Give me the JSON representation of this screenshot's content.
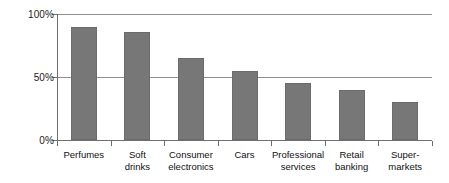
{
  "chart_data": {
    "type": "bar",
    "title": "",
    "subtitle": "",
    "xlabel": "",
    "ylabel": "",
    "categories": [
      "Perfumes",
      "Soft\ndrinks",
      "Consumer\nelectronics",
      "Cars",
      "Professional\nservices",
      "Retail\nbanking",
      "Super-\nmarkets"
    ],
    "values": [
      90,
      86,
      65,
      55,
      45,
      40,
      30
    ],
    "value_unit": "%",
    "ylim": [
      0,
      100
    ],
    "yticks": [
      0,
      50,
      100
    ],
    "ytick_labels": [
      "0%",
      "50%",
      "100%"
    ],
    "grid": "horizontal",
    "legend": "none",
    "bar_color": "#777777",
    "axis_color": "#6e6e6e",
    "gridline_color": "#8f8f8f",
    "background_color": "#ffffff"
  }
}
